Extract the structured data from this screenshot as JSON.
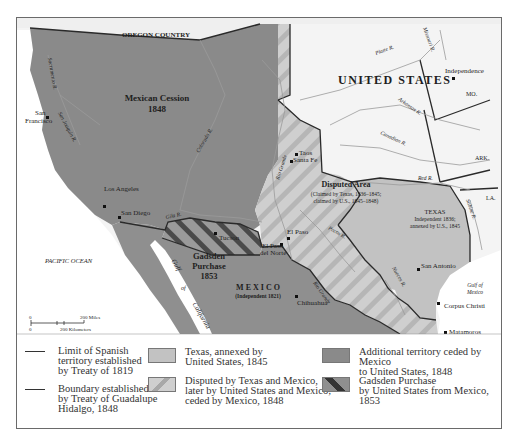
{
  "colors": {
    "mexican_cession": "#8a8a8a",
    "mexico": "#8f8f8f",
    "texas": "#c2c2c2",
    "disputed_base": "#cfcfcf",
    "disputed_stripe": "#b4b4b4",
    "united_states": "#f4f4f4",
    "ocean": "#ffffff",
    "oregon": "#efefef",
    "border": "#2a2a2a",
    "river": "#9a9a9a"
  },
  "map": {
    "regions": {
      "oregon_country": "OREGON COUNTRY",
      "united_states": "UNITED STATES",
      "mexican_cession_title": "Mexican Cession",
      "mexican_cession_year": "1848",
      "disputed_title": "Disputed Area",
      "disputed_note1": "(Claimed by Texas, 1836–1845;",
      "disputed_note2": "claimed by U.S., 1845–1848)",
      "texas_title": "TEXAS",
      "texas_note1": "Independent 1836;",
      "texas_note2": "annexed by U.S., 1845",
      "gadsden_title1": "Gadsden",
      "gadsden_title2": "Purchase",
      "gadsden_year": "1853",
      "mexico_title": "M E X I C O",
      "mexico_note": "(Independent 1821)",
      "pacific_ocean": "PACIFIC OCEAN",
      "gulf_of_mexico1": "Gulf of",
      "gulf_of_mexico2": "Mexico",
      "gulf_of_california1": "Gulf",
      "gulf_of_california2": "of",
      "gulf_of_california3": "California"
    },
    "states": {
      "mo": "MO.",
      "ark": "ARK.",
      "la": "LA."
    },
    "rivers": {
      "sacramento": "Sacramento R.",
      "san_joaquin": "San Joaquin R.",
      "colorado": "Colorado R.",
      "gila": "Gila R.",
      "rio_grande_north": "Rio Grande",
      "rio_grande_south": "Rio Grande",
      "pecos": "Pecos R.",
      "nueces": "Nueces R.",
      "sabine": "Sabine R.",
      "red": "Red R.",
      "canadian": "Canadian R.",
      "arkansas": "Arkansas R.",
      "platte": "Platte R.",
      "missouri": "Missouri R."
    },
    "cities": [
      {
        "name": "San Francisco",
        "line1": "San",
        "line2": "Francisco"
      },
      {
        "name": "Los Angeles"
      },
      {
        "name": "San Diego"
      },
      {
        "name": "Tucson"
      },
      {
        "name": "El Paso"
      },
      {
        "name": "El Paso del Norte",
        "line1": "El Paso",
        "line2": "del Norte"
      },
      {
        "name": "Taos"
      },
      {
        "name": "Santa Fe"
      },
      {
        "name": "Independence"
      },
      {
        "name": "San Antonio"
      },
      {
        "name": "Corpus Christi"
      },
      {
        "name": "Matamoros"
      },
      {
        "name": "Chihuahua"
      }
    ],
    "scale": {
      "zero_top": "0",
      "zero_bottom": "0",
      "miles": "200 Miles",
      "kilometers": "200 Kilometers"
    }
  },
  "legend": {
    "items": [
      {
        "type": "line",
        "label": "Limit of Spanish\nterritory established\nby Treaty of 1819"
      },
      {
        "type": "line",
        "label": "Boundary established\nby Treaty of Guadalupe\nHidalgo, 1848"
      },
      {
        "type": "swatch",
        "label": "Texas, annexed by\nUnited States, 1845"
      },
      {
        "type": "swatch",
        "label": "Disputed by Texas and Mexico,\nlater by United States and Mexico;\nceded by Mexico, 1848"
      },
      {
        "type": "swatch",
        "label": "Additional territory ceded by Mexico\nto United States, 1848"
      },
      {
        "type": "swatch",
        "label": "Gadsden Purchase\nby United States from Mexico, 1853"
      }
    ]
  }
}
